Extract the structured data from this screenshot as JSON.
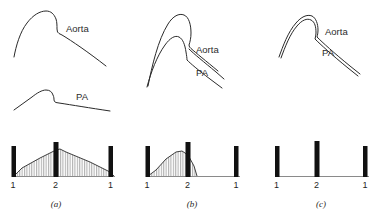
{
  "figure": {
    "title": "",
    "background_color": "#ffffff",
    "ink_color": "#2a2a2a",
    "bar_color": "#111111",
    "baseline_color": "#8a8a8a"
  },
  "labels": {
    "aorta": "Aorta",
    "pa": "PA",
    "s1": "1",
    "s2": "2",
    "s1_repeat": "1"
  },
  "panels": [
    {
      "id": "a",
      "letter": "(a)",
      "pressure_traces": {
        "aorta": {
          "label": "Aorta",
          "shape": "high-amplitude rounded peak with dicrotic notch, separate upper trace"
        },
        "pa": {
          "label": "PA",
          "shape": "low-amplitude flattened peak, separate lower trace"
        }
      },
      "phonocardiogram": {
        "sounds": [
          {
            "label": "1",
            "height": "medium"
          },
          {
            "label": "2",
            "height": "tall"
          },
          {
            "label": "1",
            "height": "medium"
          }
        ],
        "murmur": {
          "type": "continuous",
          "timing": "systolic and diastolic",
          "peak_at": "2",
          "fill": "vertical-hatch"
        }
      }
    },
    {
      "id": "b",
      "letter": "(b)",
      "pressure_traces": {
        "aorta": {
          "label": "Aorta",
          "shape": "tall peak, merging with PA on downslope"
        },
        "pa": {
          "label": "PA",
          "shape": "lower peak rising from shared foot, merging with aorta on downslope"
        }
      },
      "phonocardiogram": {
        "sounds": [
          {
            "label": "1",
            "height": "medium"
          },
          {
            "label": "2",
            "height": "tall"
          },
          {
            "label": "1",
            "height": "medium"
          }
        ],
        "murmur": {
          "type": "systolic-only",
          "timing": "systolic",
          "peak_at": "mid-systole",
          "fill": "vertical-hatch"
        }
      }
    },
    {
      "id": "c",
      "letter": "(c)",
      "pressure_traces": {
        "aorta": {
          "label": "Aorta",
          "shape": "single overlapping trace, pressures equalized"
        },
        "pa": {
          "label": "PA",
          "shape": "superimposed on aorta trace"
        }
      },
      "phonocardiogram": {
        "sounds": [
          {
            "label": "1",
            "height": "medium"
          },
          {
            "label": "2",
            "height": "tall"
          },
          {
            "label": "1",
            "height": "medium"
          }
        ],
        "murmur": {
          "type": "none",
          "timing": "absent",
          "peak_at": "",
          "fill": "none"
        }
      }
    }
  ]
}
